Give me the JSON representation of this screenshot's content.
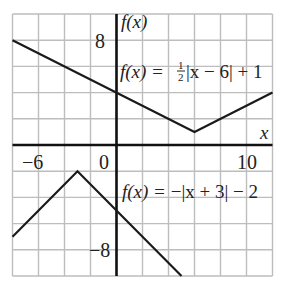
{
  "chart_data": {
    "type": "line",
    "title": "",
    "xlabel": "x",
    "ylabel": "f(x)",
    "xlim": [
      -8,
      12
    ],
    "ylim": [
      -10,
      10
    ],
    "grid": true,
    "grid_step": 2,
    "tick_labels": {
      "x": [
        {
          "value": -6,
          "label": "−6"
        },
        {
          "value": 0,
          "label": "0"
        },
        {
          "value": 10,
          "label": "10"
        }
      ],
      "y": [
        {
          "value": 8,
          "label": "8"
        },
        {
          "value": -8,
          "label": "−8"
        }
      ]
    },
    "series": [
      {
        "name": "f(x) = ½|x − 6| + 1",
        "label_prefix": "f(x) = ",
        "label_frac_num": "1",
        "label_frac_den": "2",
        "label_rest": "|x − 6| + 1",
        "vertex": [
          6,
          1
        ],
        "x": [
          -8,
          6,
          12
        ],
        "y": [
          8,
          1,
          4
        ]
      },
      {
        "name": "f(x) = −|x + 3| − 2",
        "label_prefix": "f(x) = ",
        "label_rest": "−|x + 3| − 2",
        "vertex": [
          -3,
          -2
        ],
        "x": [
          -8,
          -3,
          5
        ],
        "y": [
          -7,
          -2,
          -10
        ]
      }
    ],
    "colors": {
      "curve": "#1a1a1a",
      "axis": "#111111",
      "grid": "#bdbdbd"
    }
  }
}
